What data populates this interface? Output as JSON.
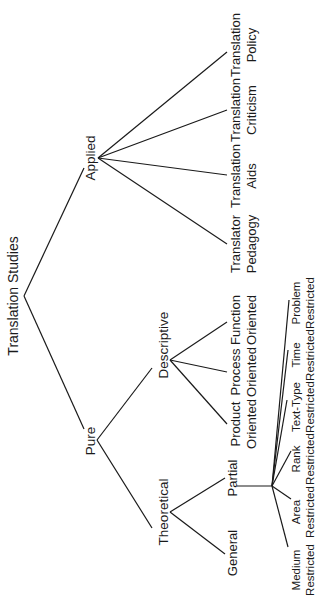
{
  "diagram": {
    "title": "Translation Studies",
    "root": {
      "label": "Translation Studies"
    },
    "branches": {
      "applied": {
        "label": "Applied",
        "children": [
          {
            "line1": "Translator",
            "line2": "Pedagogy"
          },
          {
            "line1": "Translation",
            "line2": "Aids"
          },
          {
            "line1": "Translation",
            "line2": "Criticism"
          },
          {
            "line1": "Translation",
            "line2": "Policy"
          }
        ]
      },
      "pure": {
        "label": "Pure",
        "descriptive": {
          "label": "Descriptive",
          "children": [
            {
              "line1": "Product",
              "line2": "Oriented"
            },
            {
              "line1": "Process",
              "line2": "Oriented"
            },
            {
              "line1": "Function",
              "line2": "Oriented"
            }
          ]
        },
        "theoretical": {
          "label": "Theoretical",
          "general": {
            "label": "General"
          },
          "partial": {
            "label": "Partial",
            "children": [
              {
                "line1": "Medium",
                "line2": "Restricted"
              },
              {
                "line1": "Area",
                "line2": "Restricted"
              },
              {
                "line1": "Rank",
                "line2": "Restricted"
              },
              {
                "line1": "Text-Type",
                "line2": "Restricted"
              },
              {
                "line1": "Time",
                "line2": "Restricted"
              },
              {
                "line1": "Problem",
                "line2": "Restricted"
              }
            ]
          }
        }
      }
    }
  },
  "colors": {
    "line": "#1a1a1a",
    "text": "#1a1a1a",
    "background": "#ffffff"
  }
}
